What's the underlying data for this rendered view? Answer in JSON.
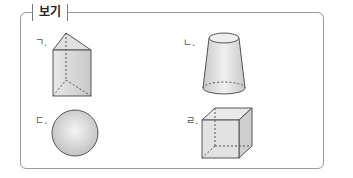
{
  "title": "보기",
  "items": [
    {
      "label": "ㄱ.",
      "shape": "triangular-prism"
    },
    {
      "label": "ㄴ.",
      "shape": "truncated-cone"
    },
    {
      "label": "ㄷ.",
      "shape": "sphere"
    },
    {
      "label": "ㄹ.",
      "shape": "cube"
    }
  ],
  "colors": {
    "border": "#9a9a9a",
    "fill": "#dcdcdc",
    "stroke": "#555555"
  }
}
